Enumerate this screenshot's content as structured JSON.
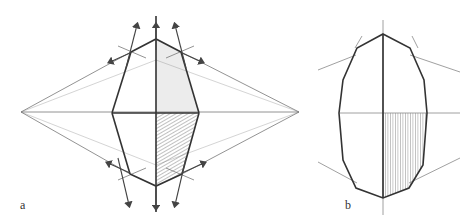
{
  "figure": {
    "panels": [
      {
        "label": "a",
        "description": "Perspective construction of hexagonal form with vanishing lines and arrows"
      },
      {
        "label": "b",
        "description": "Elongated octagonal/oval form with shaded lower-right quadrant"
      }
    ],
    "colors": {
      "line": "#3a3a3a",
      "light_line": "#9a9a9a",
      "shade": "#8a8a8a"
    }
  }
}
